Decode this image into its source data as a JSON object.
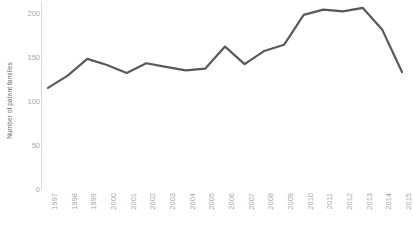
{
  "chart_data": {
    "type": "line",
    "title": "",
    "subtitle": "",
    "xlabel": "",
    "ylabel": "Number of patent families",
    "categories": [
      "1997",
      "1998",
      "1999",
      "2000",
      "2001",
      "2002",
      "2003",
      "2004",
      "2005",
      "2006",
      "2007",
      "2008",
      "2009",
      "2010",
      "2011",
      "2012",
      "2013",
      "2014",
      "2015"
    ],
    "values": [
      116,
      130,
      149,
      142,
      133,
      144,
      140,
      136,
      138,
      163,
      143,
      158,
      165,
      199,
      205,
      203,
      207,
      182,
      134
    ],
    "series": [
      {
        "name": "Number of patent families",
        "values": [
          116,
          130,
          149,
          142,
          133,
          144,
          140,
          136,
          138,
          163,
          143,
          158,
          165,
          199,
          205,
          203,
          207,
          182,
          134
        ]
      }
    ],
    "ylim": [
      0,
      215
    ],
    "yticks": [
      0,
      50,
      100,
      150,
      200
    ],
    "ytick_labels": [
      "0",
      "50",
      "100",
      "150",
      "200"
    ],
    "grid": false,
    "legend": false,
    "legend_position": "none",
    "line_color": "#595959",
    "line_width": 2.2,
    "axis_color": "#d9d9d9",
    "tick_label_color": "#a6a6a6",
    "axis_title_color": "#6a6a6a"
  },
  "axes": {
    "y_title": "Number of patent families"
  }
}
